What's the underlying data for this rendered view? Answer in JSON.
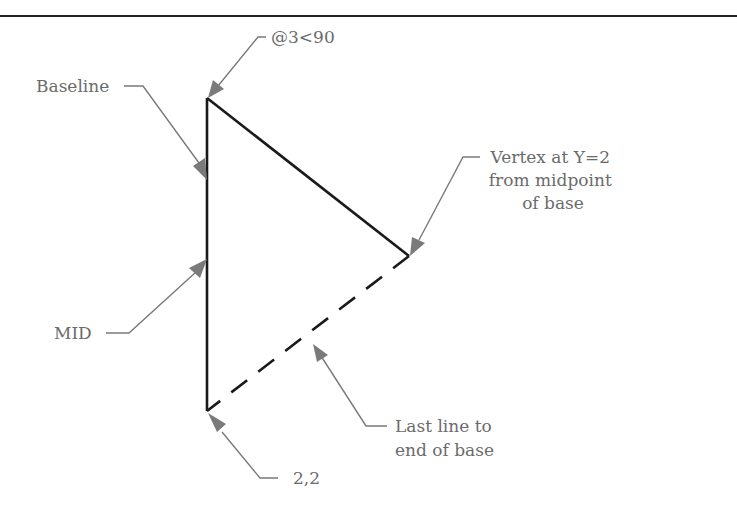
{
  "figure": {
    "top_rule": {
      "y": 16,
      "color": "#222222"
    },
    "triangle": {
      "vertices": {
        "top": [
          207,
          98
        ],
        "bottom": [
          207,
          411
        ],
        "right": [
          409,
          256
        ]
      },
      "solid_edges": [
        "bottom-top",
        "top-right"
      ],
      "dashed_edges": [
        "right-bottom"
      ],
      "stroke_color": "#1a1a1a"
    },
    "callouts": [
      {
        "id": "polar",
        "text": "@3<90",
        "target": "top vertex"
      },
      {
        "id": "baseline",
        "text": "Baseline",
        "target": "left edge"
      },
      {
        "id": "vertex",
        "lines": [
          "Vertex at Y=2",
          "from midpoint",
          "of base"
        ],
        "target": "right vertex"
      },
      {
        "id": "mid",
        "text": "MID",
        "target": "midpoint of left edge"
      },
      {
        "id": "last-line",
        "lines": [
          "Last line to",
          "end of base"
        ],
        "target": "dashed edge"
      },
      {
        "id": "start",
        "text": "2,2",
        "target": "bottom vertex"
      }
    ],
    "leader_color": "#7a7a7a",
    "text_color": "#6b6b6b"
  },
  "labels": {
    "polar": "@3<90",
    "baseline": "Baseline",
    "vertex_line1": "Vertex at Y=2",
    "vertex_line2": "from midpoint",
    "vertex_line3": "of base",
    "mid": "MID",
    "last_line1": "Last line to",
    "last_line2": "end of base",
    "start": "2,2"
  }
}
